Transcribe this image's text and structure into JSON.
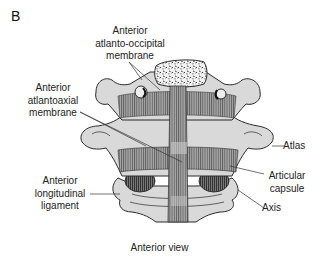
{
  "figure": {
    "panel_letter": "B",
    "caption": "Anterior view",
    "labels": {
      "anterior_atlanto_occipital_membrane": [
        "Anterior",
        "atlanto-occipital",
        "membrane"
      ],
      "anterior_atlantoaxial_membrane": [
        "Anterior",
        "atlantoaxial",
        "membrane"
      ],
      "anterior_longitudinal_ligament": [
        "Anterior",
        "longitudinal",
        "ligament"
      ],
      "atlas": [
        "Atlas"
      ],
      "articular_capsule": [
        "Articular",
        "capsule"
      ],
      "axis": [
        "Axis"
      ]
    },
    "colors": {
      "bone_fill": "#d9d9d9",
      "ligament_fill": "#8a8a8a",
      "outline": "#2a2a2a",
      "leader_line": "#333333",
      "background": "#ffffff"
    }
  }
}
